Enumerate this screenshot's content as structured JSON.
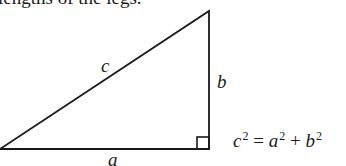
{
  "caption": "lengths of the legs.",
  "diagram": {
    "type": "right-triangle",
    "labels": {
      "hypotenuse": "c",
      "vertical_leg": "b",
      "horizontal_leg": "a"
    },
    "right_angle_marker": true
  },
  "equation": {
    "lhs": "c",
    "lhs_exp": "2",
    "equals": "=",
    "term1": "a",
    "term1_exp": "2",
    "plus": "+",
    "term2": "b",
    "term2_exp": "2"
  }
}
